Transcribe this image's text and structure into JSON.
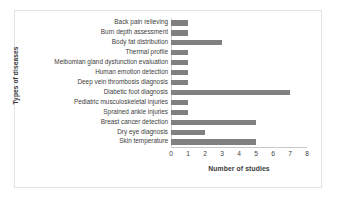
{
  "chart_data": {
    "type": "bar",
    "orientation": "horizontal",
    "title": "",
    "xlabel": "Number of studies",
    "ylabel": "Types of diseases",
    "xlim": [
      0,
      8
    ],
    "xticks": [
      "0",
      "1",
      "2",
      "3",
      "4",
      "5",
      "6",
      "7",
      "8"
    ],
    "grid": false,
    "legend": null,
    "bar_color": "#808080",
    "categories": [
      "Back pain relieving",
      "Burn depth assessment",
      "Body fat distribution",
      "Thermal profile",
      "Meibomian gland dysfunction evaluation",
      "Human emotion detection",
      "Deep vein thrombosis diagnosis",
      "Diabetic foot diagnosis",
      "Pediatric musculoskeletal injuries",
      "Sprained ankle injuries",
      "Breast cancer detection",
      "Dry eye diagnosis",
      "Skin temperature"
    ],
    "values": [
      1,
      1,
      3,
      1,
      1,
      1,
      1,
      7,
      1,
      1,
      5,
      2,
      5
    ]
  }
}
